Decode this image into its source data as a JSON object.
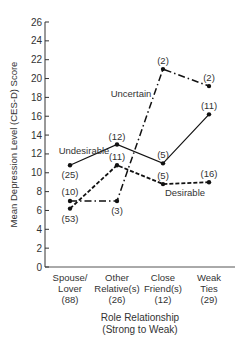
{
  "chart_data": {
    "type": "line",
    "title": "",
    "xlabel": "Role Relationship (Strong to Weak)",
    "xlabel_lines": [
      "Role Relationship",
      "(Strong to Weak)"
    ],
    "ylabel": "Mean Depression Level (CES-D) Score",
    "ylim": [
      0,
      26
    ],
    "yticks": [
      0,
      2,
      4,
      6,
      8,
      10,
      12,
      14,
      16,
      18,
      20,
      22,
      24,
      26
    ],
    "grid": false,
    "legend": "inline labels",
    "categories": [
      {
        "lines": [
          "Spouse/",
          "Lover",
          "(88)"
        ]
      },
      {
        "lines": [
          "Other",
          "Relative(s)",
          "(26)"
        ]
      },
      {
        "lines": [
          "Close",
          "Friend(s)",
          "(12)"
        ]
      },
      {
        "lines": [
          "Weak",
          "Ties",
          "(29)"
        ]
      }
    ],
    "series": [
      {
        "name": "Undesirable",
        "style": "solid",
        "values": [
          10.8,
          13.0,
          11.0,
          16.2
        ],
        "n_labels": [
          "(25)",
          "(12)",
          "(5)",
          "(11)"
        ]
      },
      {
        "name": "Desirable",
        "style": "dashed",
        "values": [
          6.2,
          10.8,
          8.8,
          9.0
        ],
        "n_labels": [
          "(53)",
          "(11)",
          "(5)",
          "(16)"
        ]
      },
      {
        "name": "Uncertain",
        "style": "dash-dot",
        "values": [
          7.0,
          7.0,
          21.0,
          19.2
        ],
        "n_labels": [
          "(10)",
          "(3)",
          "(2)",
          "(2)"
        ]
      }
    ]
  }
}
